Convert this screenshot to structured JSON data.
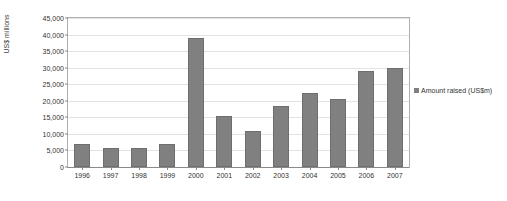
{
  "chart_data": {
    "type": "bar",
    "title": "",
    "subtitle": "",
    "xlabel": "",
    "ylabel": "US$ millions",
    "categories": [
      "1996",
      "1997",
      "1998",
      "1999",
      "2000",
      "2001",
      "2002",
      "2003",
      "2004",
      "2005",
      "2006",
      "2007"
    ],
    "series": [
      {
        "name": "Amount raised (US$m)",
        "color": "#808080",
        "values": [
          7000,
          5800,
          5700,
          7100,
          39000,
          15500,
          11000,
          18500,
          22500,
          20500,
          29000,
          29800
        ]
      }
    ],
    "ylim": [
      0,
      45000
    ],
    "ytick_values": [
      0,
      5000,
      10000,
      15000,
      20000,
      25000,
      30000,
      35000,
      40000,
      45000
    ],
    "ytick_labels": [
      "0",
      "5,000",
      "10,000",
      "15,000",
      "20,000",
      "25,000",
      "30,000",
      "35,000",
      "40,000",
      "45,000"
    ],
    "grid": true,
    "grid_axis": "y",
    "legend": [
      "Amount raised (US$m)"
    ],
    "legend_position": "right",
    "annotations": []
  },
  "colors": {
    "bar": "#808080",
    "bar_border": "#6e6e6e",
    "gridline": "#e2e2e2",
    "axis": "#8a8a8a",
    "plot_border": "#b0b0b0",
    "text": "#333333",
    "background": "#ffffff"
  }
}
